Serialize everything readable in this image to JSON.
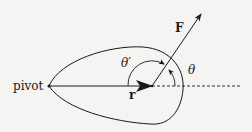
{
  "labels": {
    "pivot": "pivot",
    "force": "F",
    "radius": "r",
    "theta": "θ",
    "theta_prime": "θ′"
  },
  "colors": {
    "stroke": "#1a1a1a",
    "background": "#f4f4f2"
  }
}
